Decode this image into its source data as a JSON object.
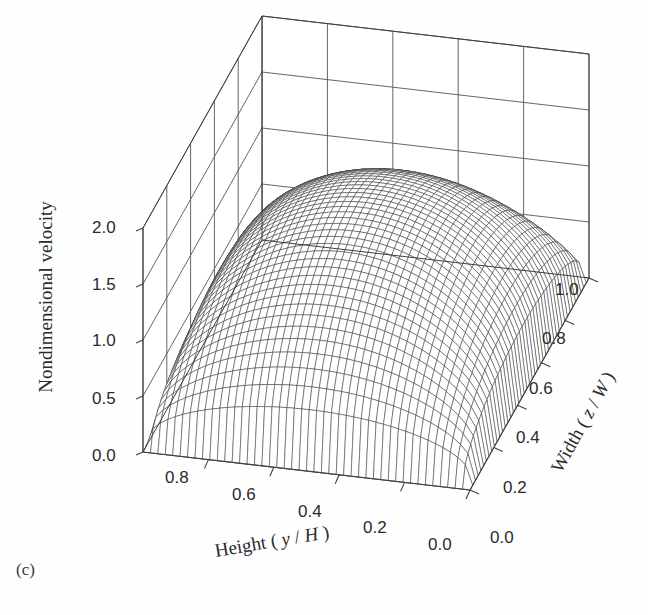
{
  "figure": {
    "panel_label": "(c)",
    "background_color": "#fefefe",
    "line_color": "#555555",
    "mesh_color": "#3b3b3b",
    "text_color": "#2b2b2b"
  },
  "axes": {
    "z": {
      "title": "Nondimensional velocity",
      "ticks": [
        "0.0",
        "0.5",
        "1.0",
        "1.5",
        "2.0"
      ],
      "values": [
        0.0,
        0.5,
        1.0,
        1.5,
        2.0
      ],
      "range": [
        0.0,
        2.0
      ]
    },
    "x": {
      "title_plain": "Height",
      "title_open": "(",
      "title_var1": "y",
      "title_slash": "/",
      "title_var2": "H",
      "title_close": ")",
      "ticks": [
        "0.8",
        "0.6",
        "0.4",
        "0.2",
        "0.0"
      ],
      "values": [
        0.8,
        0.6,
        0.4,
        0.2,
        0.0
      ],
      "range": [
        0.0,
        1.0
      ]
    },
    "y": {
      "title_plain": "Width",
      "title_open": "(",
      "title_var1": "z",
      "title_slash": "/",
      "title_var2": "W",
      "title_close": ")",
      "ticks": [
        "0.0",
        "0.2",
        "0.4",
        "0.6",
        "0.8",
        "1.0"
      ],
      "values": [
        0.0,
        0.2,
        0.4,
        0.6,
        0.8,
        1.0
      ],
      "range": [
        0.0,
        1.0
      ]
    }
  },
  "chart_data": {
    "type": "surface",
    "title": "",
    "xlabel": "Height ( y / H )",
    "ylabel": "Width ( z / W )",
    "zlabel": "Nondimensional velocity",
    "xlim": [
      0.0,
      1.0
    ],
    "ylim": [
      0.0,
      1.0
    ],
    "zlim": [
      0.0,
      2.0
    ],
    "grid": true,
    "legend": "none",
    "mesh_n_x": 44,
    "mesh_n_y": 44,
    "surface_peak_value": 1.45,
    "surface_min_value": 0.0,
    "x": [
      0.0,
      0.1,
      0.2,
      0.3,
      0.4,
      0.5,
      0.6,
      0.7,
      0.8,
      0.9,
      1.0
    ],
    "y": [
      0.0,
      0.1,
      0.2,
      0.3,
      0.4,
      0.5,
      0.6,
      0.7,
      0.8,
      0.9,
      1.0
    ],
    "z_grid": [
      [
        0.0,
        0.0,
        0.0,
        0.0,
        0.0,
        0.0,
        0.0,
        0.0,
        0.0,
        0.0,
        0.0
      ],
      [
        0.0,
        0.38,
        0.62,
        0.77,
        0.86,
        0.9,
        0.86,
        0.77,
        0.62,
        0.38,
        0.0
      ],
      [
        0.0,
        0.62,
        0.98,
        1.17,
        1.28,
        1.32,
        1.28,
        1.17,
        0.98,
        0.62,
        0.0
      ],
      [
        0.0,
        0.77,
        1.17,
        1.35,
        1.43,
        1.45,
        1.43,
        1.35,
        1.17,
        0.77,
        0.0
      ],
      [
        0.0,
        0.86,
        1.28,
        1.43,
        1.46,
        1.46,
        1.46,
        1.43,
        1.28,
        0.86,
        0.0
      ],
      [
        0.0,
        0.9,
        1.32,
        1.45,
        1.46,
        1.45,
        1.46,
        1.45,
        1.32,
        0.9,
        0.0
      ],
      [
        0.0,
        0.86,
        1.28,
        1.43,
        1.46,
        1.46,
        1.46,
        1.43,
        1.28,
        0.86,
        0.0
      ],
      [
        0.0,
        0.77,
        1.17,
        1.35,
        1.43,
        1.45,
        1.43,
        1.35,
        1.17,
        0.77,
        0.0
      ],
      [
        0.0,
        0.62,
        0.98,
        1.17,
        1.28,
        1.32,
        1.28,
        1.17,
        0.98,
        0.62,
        0.0
      ],
      [
        0.0,
        0.38,
        0.62,
        0.77,
        0.86,
        0.9,
        0.86,
        0.77,
        0.62,
        0.38,
        0.0
      ],
      [
        0.0,
        0.0,
        0.0,
        0.0,
        0.0,
        0.0,
        0.0,
        0.0,
        0.0,
        0.0,
        0.0
      ]
    ]
  },
  "tick_positions": {
    "z": [
      {
        "label": "2.0",
        "left": 92,
        "top": 218
      },
      {
        "label": "1.5",
        "left": 92,
        "top": 275
      },
      {
        "label": "1.0",
        "left": 92,
        "top": 331
      },
      {
        "label": "0.5",
        "left": 92,
        "top": 389
      },
      {
        "label": "0.0",
        "left": 92,
        "top": 446
      }
    ],
    "x": [
      {
        "label": "0.8",
        "left": 165,
        "top": 468
      },
      {
        "label": "0.6",
        "left": 232,
        "top": 485
      },
      {
        "label": "0.4",
        "left": 298,
        "top": 502
      },
      {
        "label": "0.2",
        "left": 363,
        "top": 518
      },
      {
        "label": "0.0",
        "left": 428,
        "top": 535
      }
    ],
    "y": [
      {
        "label": "0.0",
        "left": 490,
        "top": 528
      },
      {
        "label": "0.2",
        "left": 503,
        "top": 478
      },
      {
        "label": "0.4",
        "left": 516,
        "top": 428
      },
      {
        "label": "0.6",
        "left": 529,
        "top": 379
      },
      {
        "label": "0.8",
        "left": 542,
        "top": 329
      },
      {
        "label": "1.0",
        "left": 555,
        "top": 280
      }
    ]
  }
}
